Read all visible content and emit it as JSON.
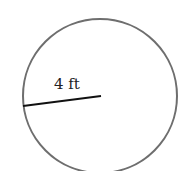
{
  "diagram": {
    "shape": "circle",
    "radius_label": "4 ft",
    "colors": {
      "circle_stroke": "#6e6e6e",
      "radius_line": "#111111",
      "background": "#ffffff"
    }
  }
}
